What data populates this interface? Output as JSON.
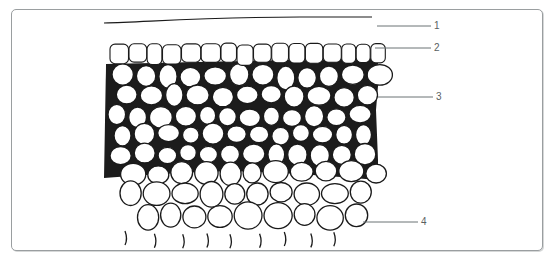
{
  "figure": {
    "type": "tissue-section-diagram",
    "frame_border_color": "#9a9ea0",
    "ink_color": "#1a1a1a",
    "leader_color": "#6b7375",
    "labels": [
      {
        "id": "1",
        "text": "1",
        "y": 26
      },
      {
        "id": "2",
        "text": "2",
        "y": 48
      },
      {
        "id": "3",
        "text": "3",
        "y": 97
      },
      {
        "id": "4",
        "text": "4",
        "y": 221
      }
    ]
  }
}
